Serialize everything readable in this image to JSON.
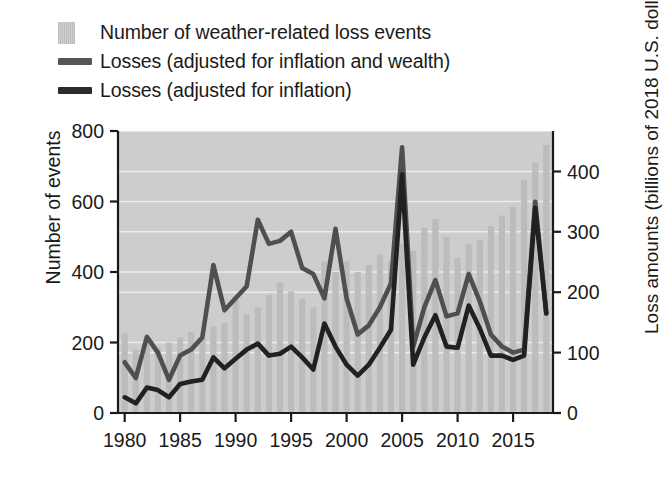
{
  "legend": {
    "position": "above-plot",
    "items": [
      {
        "label": "Number of weather-related loss events",
        "icon": "bar-swatch",
        "type": "bar",
        "color": "#c9c9c9"
      },
      {
        "label": "Losses (adjusted for inflation and wealth)",
        "icon": "line-swatch",
        "type": "line",
        "color": "#555555"
      },
      {
        "label": "Losses (adjusted for inflation)",
        "icon": "line-swatch",
        "type": "line",
        "color": "#2b2b2b"
      }
    ]
  },
  "axes": {
    "left": {
      "title": "Number of events",
      "ticks": [
        "0",
        "200",
        "400",
        "600",
        "800"
      ],
      "min": 0,
      "max": 800,
      "step": 200
    },
    "right": {
      "title": "Loss amounts (billions of 2018 U.S. dollars)",
      "ticks": [
        "0",
        "100",
        "200",
        "300",
        "400"
      ],
      "min": 0,
      "max": 467,
      "step": 100
    },
    "bottom": {
      "title": "",
      "ticks": [
        "1980",
        "1985",
        "1990",
        "1995",
        "2000",
        "2005",
        "2010",
        "2015"
      ],
      "min": 1980,
      "max": 2018
    }
  },
  "chart_data": {
    "type": "bar",
    "title": "",
    "subtitle": "",
    "xlabel": "",
    "ylabel": "Number of events",
    "y2label": "Loss amounts (billions of 2018 U.S. dollars)",
    "xlim": [
      1979.4,
      2018.6
    ],
    "ylim": [
      0,
      800
    ],
    "y2lim": [
      0,
      467
    ],
    "grid": true,
    "legend_position": "top-left-above",
    "x": [
      1980,
      1981,
      1982,
      1983,
      1984,
      1985,
      1986,
      1987,
      1988,
      1989,
      1990,
      1991,
      1992,
      1993,
      1994,
      1995,
      1996,
      1997,
      1998,
      1999,
      2000,
      2001,
      2002,
      2003,
      2004,
      2005,
      2006,
      2007,
      2008,
      2009,
      2010,
      2011,
      2012,
      2013,
      2014,
      2015,
      2016,
      2017,
      2018
    ],
    "categories": [
      "1980",
      "1981",
      "1982",
      "1983",
      "1984",
      "1985",
      "1986",
      "1987",
      "1988",
      "1989",
      "1990",
      "1991",
      "1992",
      "1993",
      "1994",
      "1995",
      "1996",
      "1997",
      "1998",
      "1999",
      "2000",
      "2001",
      "2002",
      "2003",
      "2004",
      "2005",
      "2006",
      "2007",
      "2008",
      "2009",
      "2010",
      "2011",
      "2012",
      "2013",
      "2014",
      "2015",
      "2016",
      "2017",
      "2018"
    ],
    "series": [
      {
        "name": "Number of weather-related loss events",
        "type": "bar",
        "axis": "left",
        "unit": "events",
        "color": "#bcbcbc",
        "values": [
          225,
          180,
          195,
          185,
          200,
          215,
          230,
          215,
          245,
          255,
          330,
          280,
          300,
          335,
          370,
          345,
          325,
          300,
          430,
          400,
          430,
          400,
          420,
          450,
          430,
          480,
          460,
          525,
          550,
          500,
          440,
          480,
          490,
          530,
          560,
          585,
          660,
          710,
          760
        ]
      },
      {
        "name": "Losses (adjusted for inflation and wealth)",
        "type": "line",
        "axis": "right",
        "unit": "billions of 2018 USD",
        "color": "#4f4f4f",
        "values": [
          84,
          58,
          126,
          100,
          55,
          95,
          105,
          125,
          245,
          170,
          190,
          210,
          320,
          280,
          285,
          300,
          240,
          230,
          190,
          305,
          190,
          130,
          145,
          175,
          215,
          440,
          110,
          175,
          220,
          160,
          165,
          230,
          185,
          130,
          110,
          100,
          105,
          350,
          165
        ]
      },
      {
        "name": "Losses (adjusted for inflation)",
        "type": "line",
        "axis": "right",
        "unit": "billions of 2018 USD",
        "color": "#212121",
        "values": [
          26,
          16,
          42,
          38,
          26,
          48,
          52,
          55,
          92,
          74,
          90,
          105,
          115,
          95,
          98,
          110,
          92,
          72,
          148,
          110,
          80,
          62,
          80,
          108,
          138,
          395,
          80,
          125,
          162,
          110,
          108,
          178,
          140,
          95,
          95,
          88,
          95,
          340,
          165
        ]
      }
    ]
  }
}
